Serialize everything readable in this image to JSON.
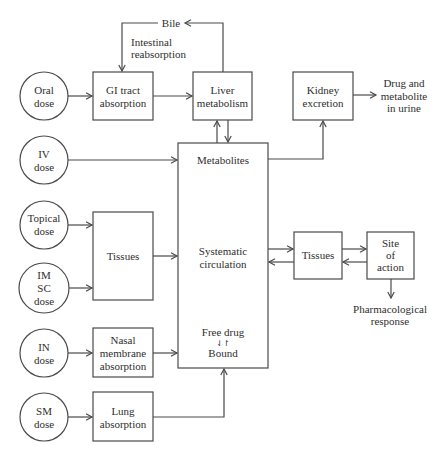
{
  "nodes": {
    "oral_dose": [
      "Oral",
      "dose"
    ],
    "iv_dose": [
      "IV",
      "dose"
    ],
    "topical_dose": [
      "Topical",
      "dose"
    ],
    "im_sc_dose": [
      "IM",
      "SC",
      "dose"
    ],
    "in_dose": [
      "IN",
      "dose"
    ],
    "sm_dose": [
      "SM",
      "dose"
    ],
    "gi_tract": [
      "GI tract",
      "absorption"
    ],
    "tissues_left": [
      "Tissues"
    ],
    "nasal": [
      "Nasal",
      "membrane",
      "absorption"
    ],
    "lung": [
      "Lung",
      "absorption"
    ],
    "liver": [
      "Liver",
      "metabolism"
    ],
    "kidney": [
      "Kidney",
      "excretion"
    ],
    "circulation": {
      "metabolites": "Metabolites",
      "systematic": [
        "Systematic",
        "circulation"
      ],
      "free_drug": "Free drug",
      "equilibrium_symbol": "⇃↾",
      "bound": "Bound"
    },
    "tissues_right": [
      "Tissues"
    ],
    "site_of_action": [
      "Site",
      "of",
      "action"
    ]
  },
  "labels": {
    "bile": "Bile",
    "intestinal_reabsorption": [
      "Intestinal",
      "reabsorption"
    ],
    "urine_output": [
      "Drug and",
      "metabolite",
      "in urine"
    ],
    "pharmacological_response": [
      "Pharmacological",
      "response"
    ]
  },
  "colors": {
    "line": "#4a4a4a",
    "text": "#2e2e2e",
    "background": "#ffffff"
  }
}
